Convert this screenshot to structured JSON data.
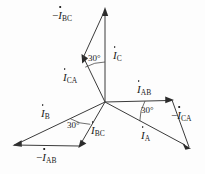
{
  "diagram": {
    "type": "phasor-diagram",
    "background_color": "#fdfdfd",
    "line_color": "#3b3b3b",
    "origin": {
      "x": 105,
      "y": 102
    },
    "angle_unit": "degrees",
    "labels": {
      "minus_i_bc": {
        "prefix": "−",
        "symbol": "I",
        "subscript": "BC",
        "x": 52,
        "y": 10
      },
      "i_c": {
        "prefix": "",
        "symbol": "I",
        "subscript": "C",
        "x": 113,
        "y": 50
      },
      "i_ca": {
        "prefix": "",
        "symbol": "I",
        "subscript": "CA",
        "x": 63,
        "y": 72
      },
      "i_ab": {
        "prefix": "",
        "symbol": "I",
        "subscript": "AB",
        "x": 137,
        "y": 84
      },
      "minus_i_ca": {
        "prefix": "−",
        "symbol": "I",
        "subscript": "CA",
        "x": 171,
        "y": 110
      },
      "i_b": {
        "prefix": "",
        "symbol": "I",
        "subscript": "B",
        "x": 41,
        "y": 108
      },
      "i_bc": {
        "prefix": "",
        "symbol": "I",
        "subscript": "BC",
        "x": 91,
        "y": 125
      },
      "i_a": {
        "prefix": "",
        "symbol": "I",
        "subscript": "A",
        "x": 141,
        "y": 130
      },
      "minus_i_ab": {
        "prefix": "−",
        "symbol": "I",
        "subscript": "AB",
        "x": 36,
        "y": 152
      }
    },
    "angles": [
      {
        "name": "angle-c",
        "text": "30°",
        "x": 88,
        "y": 53
      },
      {
        "name": "angle-a",
        "text": "30°",
        "x": 141,
        "y": 105
      },
      {
        "name": "angle-b",
        "text": "30°",
        "x": 67,
        "y": 120
      }
    ],
    "phasors": [
      {
        "name": "i-c",
        "label": "İC",
        "angle_deg": 90,
        "kind": "line-current"
      },
      {
        "name": "i-a",
        "label": "İA",
        "angle_deg": -30,
        "kind": "line-current"
      },
      {
        "name": "i-b",
        "label": "İB",
        "angle_deg": 210,
        "kind": "line-current"
      },
      {
        "name": "i-ab",
        "label": "İAB",
        "angle_deg": 0,
        "kind": "phase-current"
      },
      {
        "name": "i-bc",
        "label": "İBC",
        "angle_deg": 240,
        "kind": "phase-current"
      },
      {
        "name": "i-ca",
        "label": "İCA",
        "angle_deg": 120,
        "kind": "phase-current"
      },
      {
        "name": "minus-i-ab",
        "label": "−İAB",
        "angle_deg": 180,
        "kind": "negated-phase-current"
      },
      {
        "name": "minus-i-bc",
        "label": "−İBC",
        "angle_deg": 60,
        "kind": "negated-phase-current"
      },
      {
        "name": "minus-i-ca",
        "label": "−İCA",
        "angle_deg": -60,
        "kind": "negated-phase-current"
      }
    ]
  }
}
